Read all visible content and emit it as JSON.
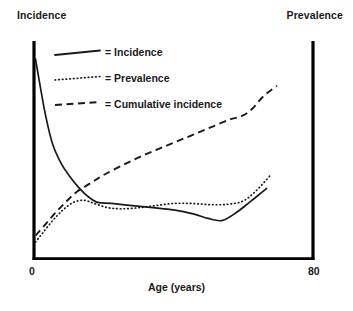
{
  "axis_labels": {
    "top_left": "Incidence",
    "top_right": "Prevalence",
    "x_title": "Age (years)",
    "x_min": "0",
    "x_max": "80"
  },
  "legend": {
    "entries": [
      {
        "label": "= Incidence",
        "style": "solid"
      },
      {
        "label": "= Prevalence",
        "style": "dotted"
      },
      {
        "label": "= Cumulative incidence",
        "style": "dashed"
      }
    ]
  },
  "colors": {
    "ink": "#1a1a1a",
    "axis": "#000000",
    "background": "#ffffff"
  },
  "chart_data": {
    "type": "line",
    "title": "",
    "subtitle": "",
    "xlabel": "Age (years)",
    "ylabel_left": "Incidence",
    "ylabel_right": "Prevalence",
    "xlim": [
      0,
      80
    ],
    "ylim": [
      0,
      1
    ],
    "grid": false,
    "legend_position": "inside-top-left",
    "x_ticks": [
      0,
      80
    ],
    "x_tick_labels": [
      "0",
      "80"
    ],
    "y_ticks": [],
    "y_tick_labels": [],
    "annotations": [],
    "series": [
      {
        "name": "Incidence",
        "style": "solid",
        "x": [
          0,
          1.5,
          3,
          5,
          7.5,
          10,
          12.5,
          15,
          18,
          22,
          28,
          34,
          40,
          46,
          50,
          54,
          58,
          62,
          67
        ],
        "values": [
          0.93,
          0.79,
          0.66,
          0.53,
          0.44,
          0.38,
          0.33,
          0.29,
          0.26,
          0.255,
          0.245,
          0.235,
          0.225,
          0.205,
          0.185,
          0.175,
          0.21,
          0.26,
          0.325
        ]
      },
      {
        "name": "Prevalence",
        "style": "dotted",
        "x": [
          0,
          2,
          5,
          8,
          11,
          14,
          17,
          21,
          25,
          30,
          35,
          40,
          45,
          50,
          55,
          60,
          64,
          68
        ],
        "values": [
          0.075,
          0.115,
          0.175,
          0.225,
          0.26,
          0.27,
          0.255,
          0.235,
          0.23,
          0.235,
          0.245,
          0.255,
          0.255,
          0.25,
          0.25,
          0.265,
          0.315,
          0.385
        ]
      },
      {
        "name": "Cumulative incidence",
        "style": "dashed",
        "x": [
          0,
          3,
          6,
          9,
          12,
          16,
          20,
          26,
          32,
          38,
          44,
          50,
          56,
          60,
          63,
          66,
          70
        ],
        "values": [
          0.105,
          0.16,
          0.215,
          0.265,
          0.31,
          0.35,
          0.39,
          0.44,
          0.485,
          0.525,
          0.565,
          0.605,
          0.645,
          0.665,
          0.7,
          0.755,
          0.805
        ]
      }
    ]
  }
}
